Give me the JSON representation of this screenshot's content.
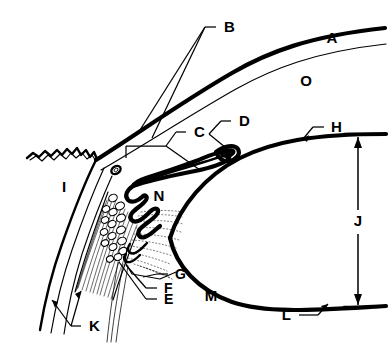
{
  "figure": {
    "type": "anatomical-line-diagram",
    "background_color": "#ffffff",
    "ink_color": "#000000",
    "width": 390,
    "height": 345
  },
  "labels": [
    {
      "id": "A",
      "text": "A",
      "x": 332,
      "y": 38,
      "has_leader": false
    },
    {
      "id": "B",
      "text": "B",
      "x": 224,
      "y": 27,
      "has_leader": true
    },
    {
      "id": "C",
      "text": "C",
      "x": 194,
      "y": 132,
      "has_leader": true
    },
    {
      "id": "D",
      "text": "D",
      "x": 239,
      "y": 121,
      "has_leader": true
    },
    {
      "id": "E",
      "text": "E",
      "x": 164,
      "y": 299,
      "has_leader": true
    },
    {
      "id": "F",
      "text": "F",
      "x": 164,
      "y": 288,
      "has_leader": true
    },
    {
      "id": "G",
      "text": "G",
      "x": 175,
      "y": 274,
      "has_leader": true
    },
    {
      "id": "H",
      "text": "H",
      "x": 331,
      "y": 127,
      "has_leader": true
    },
    {
      "id": "I",
      "text": "I",
      "x": 64,
      "y": 187,
      "has_leader": false
    },
    {
      "id": "J",
      "text": "J",
      "x": 364,
      "y": 221,
      "has_leader": false
    },
    {
      "id": "K",
      "text": "K",
      "x": 89,
      "y": 326,
      "has_leader": true
    },
    {
      "id": "L",
      "text": "L",
      "x": 291,
      "y": 315,
      "has_leader": true
    },
    {
      "id": "M",
      "text": "M",
      "x": 211,
      "y": 296,
      "has_leader": false
    },
    {
      "id": "N",
      "text": "N",
      "x": 159,
      "y": 196,
      "has_leader": false
    },
    {
      "id": "O",
      "text": "O",
      "x": 306,
      "y": 81,
      "has_leader": false
    }
  ],
  "dimension": {
    "id": "J",
    "label": "J",
    "orientation": "vertical",
    "double_headed": true,
    "top_y": 137,
    "bottom_y": 305,
    "x": 358
  }
}
